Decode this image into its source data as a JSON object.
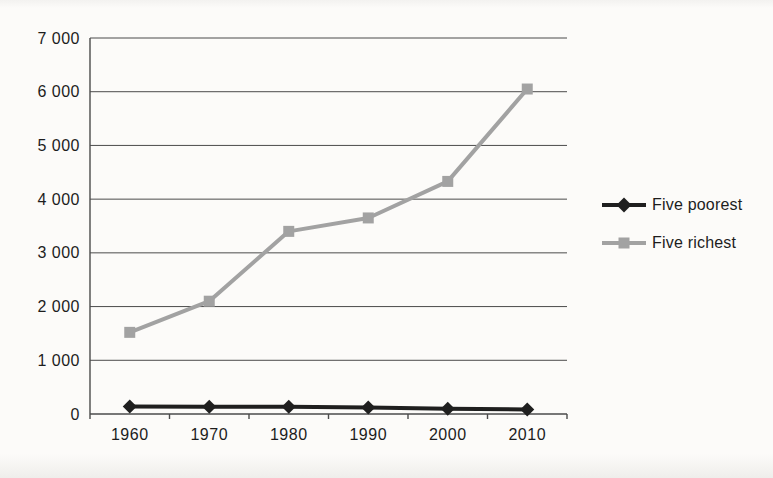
{
  "chart_data": {
    "type": "line",
    "categories": [
      "1960",
      "1970",
      "1980",
      "1990",
      "2000",
      "2010"
    ],
    "series": [
      {
        "name": "Five poorest",
        "color": "#1f1f1f",
        "marker": "diamond",
        "values": [
          140,
          135,
          135,
          120,
          100,
          85
        ]
      },
      {
        "name": "Five richest",
        "color": "#a2a2a2",
        "marker": "square",
        "values": [
          1520,
          2100,
          3400,
          3650,
          4330,
          6050
        ]
      }
    ],
    "title": "",
    "xlabel": "",
    "ylabel": "",
    "ylim": [
      0,
      7000
    ],
    "y_ticks": [
      0,
      1000,
      2000,
      3000,
      4000,
      5000,
      6000,
      7000
    ],
    "y_tick_labels": [
      "0",
      "1 000",
      "2 000",
      "3 000",
      "4 000",
      "5 000",
      "6 000",
      "7 000"
    ],
    "grid": "horizontal",
    "legend_position": "right"
  },
  "colors": {
    "axis": "#4b4b4b",
    "grid": "#4b4b4b",
    "text": "#1d1d1d",
    "background": "#fcfbf9"
  }
}
